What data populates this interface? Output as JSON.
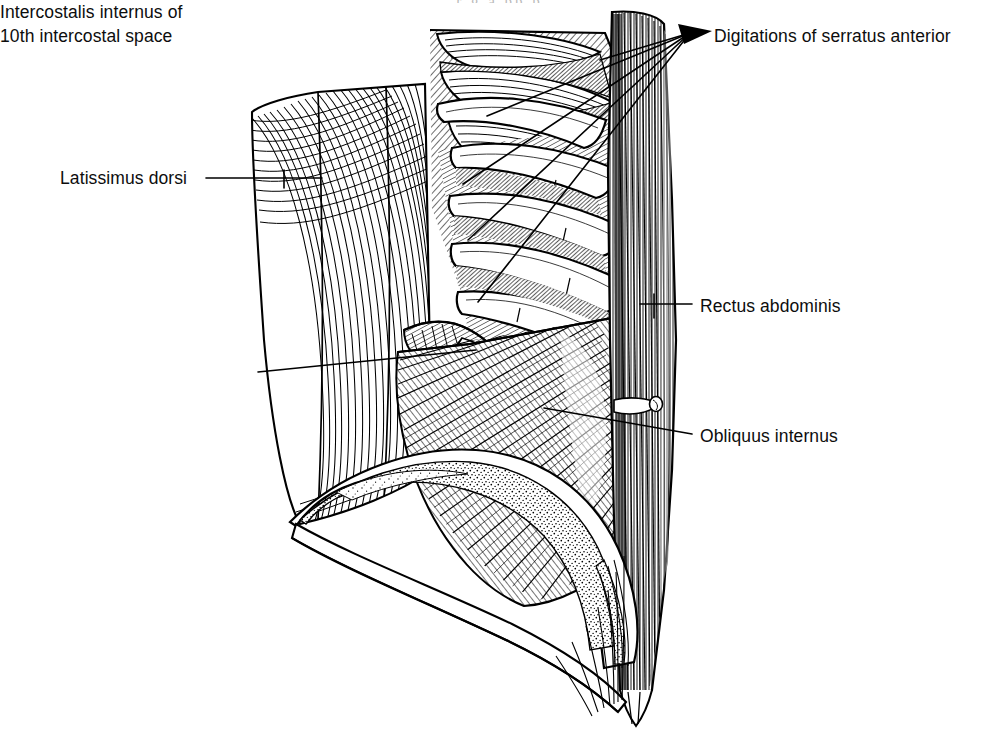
{
  "figure": {
    "kind": "line-drawing",
    "style": "black-and-white engraved hatch illustration",
    "background_color": "#ffffff",
    "ink_color": "#000000",
    "page_header_remnant": "r g   a   pp p"
  },
  "labels": {
    "digitations": {
      "text": "Digitations of serratus anterior",
      "leader": "four-line fan with arrowhead",
      "side": "right"
    },
    "latissimus": {
      "text": "Latissimus dorsi",
      "leader": "single horizontal line with tick",
      "side": "left"
    },
    "intercostalis": {
      "line1": "Intercostalis internus of",
      "line2": "10th intercostal space",
      "leader": "single rising line",
      "side": "left"
    },
    "rectus": {
      "text": "Rectus abdominis",
      "leader": "single horizontal line with tick",
      "side": "right"
    },
    "obliquus": {
      "text": "Obliquus internus",
      "leader": "single rising line",
      "side": "right"
    }
  },
  "structures": [
    {
      "name": "serratus anterior digitations",
      "count": 5,
      "region": "upper-right"
    },
    {
      "name": "ribs",
      "count": 6,
      "region": "center"
    },
    {
      "name": "intercostalis internus",
      "region": "center"
    },
    {
      "name": "latissimus dorsi",
      "region": "left"
    },
    {
      "name": "obliquus internus",
      "region": "lower-center"
    },
    {
      "name": "rectus abdominis",
      "region": "right-edge"
    },
    {
      "name": "iliac crest",
      "region": "bottom",
      "texture": "stipple"
    },
    {
      "name": "inguinal ligament",
      "region": "bottom-right"
    }
  ]
}
